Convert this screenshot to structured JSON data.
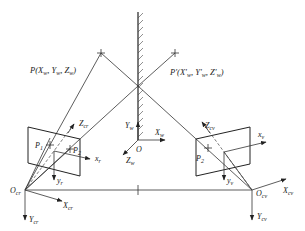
{
  "diagram": {
    "type": "stereo-vision mirror geometry",
    "labels": {
      "P": "P(X",
      "P_full": "P(Xw, Yw, Zw)",
      "P_prime_full": "P'(X'w, Y'w, Z'w)",
      "O": "O",
      "Xw": "X",
      "Xw_sub": "w",
      "Yw": "Y",
      "Yw_sub": "w",
      "Zw": "Z",
      "Zw_sub": "w",
      "P1": "P",
      "P1_sub": "1",
      "P2": "P",
      "P2_sub": "2",
      "P2r": "P",
      "P2r_sub": "2",
      "Zcr": "Z",
      "Zcr_sub": "cr",
      "xr": "x",
      "xr_sub": "r",
      "yr": "y",
      "yr_sub": "r",
      "Ocr": "O",
      "Ocr_sub": "cr",
      "Xcr": "X",
      "Xcr_sub": "cr",
      "Ycr": "Y",
      "Ycr_sub": "cr",
      "Zcv": "Z",
      "Zcv_sub": "cv",
      "xv": "x",
      "xv_sub": "v",
      "yv": "y",
      "yv_sub": "v",
      "Ocv": "O",
      "Ocv_sub": "cv",
      "Xcv": "X",
      "Xcv_sub": "cv",
      "Ycv": "Y",
      "Ycv_sub": "cv"
    },
    "points": {
      "P": [
        101,
        53
      ],
      "P_prime": [
        175,
        53
      ],
      "mirror_hit": [
        138,
        86
      ],
      "O": [
        138,
        140
      ],
      "O_cr": [
        25,
        190
      ],
      "O_cv": [
        252,
        190
      ]
    },
    "colors": {
      "line": "#333333",
      "background": "#ffffff"
    }
  }
}
